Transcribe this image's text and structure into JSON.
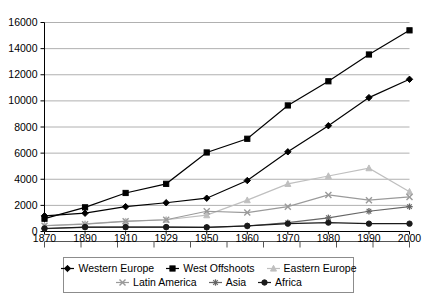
{
  "chart_data": {
    "type": "line",
    "title": "",
    "subtitle": "",
    "xlabel": "",
    "ylabel": "",
    "grid": true,
    "legend_position": "bottom",
    "x": [
      1870,
      1890,
      1910,
      1929,
      1950,
      1960,
      1970,
      1980,
      1990,
      2000
    ],
    "categories": [
      "1870",
      "1890",
      "1910",
      "1929",
      "1950",
      "1960",
      "1970",
      "1980",
      "1990",
      "2000"
    ],
    "xlim": [
      1870,
      2000
    ],
    "ylim": [
      0,
      16000
    ],
    "ytick_values": [
      0,
      2000,
      4000,
      6000,
      8000,
      10000,
      12000,
      14000,
      16000
    ],
    "ytick_labels": [
      "0",
      "2000",
      "4000",
      "6000",
      "8000",
      "10000",
      "12000",
      "14000",
      "16000"
    ],
    "series": [
      {
        "name": "Western Europe",
        "color": "#000000",
        "marker": "diamond",
        "values": [
          1200,
          1400,
          1900,
          2200,
          2550,
          3900,
          6100,
          8100,
          10250,
          11650
        ]
      },
      {
        "name": "West Offshoots",
        "color": "#000000",
        "marker": "square",
        "values": [
          980,
          1850,
          2950,
          3650,
          6050,
          7100,
          9650,
          11500,
          13550,
          15400
        ]
      },
      {
        "name": "Eastern Europe",
        "color": "#bfbfbf",
        "marker": "triangle",
        "values": [
          450,
          580,
          790,
          900,
          1250,
          2400,
          3650,
          4250,
          4850,
          3050
        ]
      },
      {
        "name": "Latin America",
        "color": "#9a9a9a",
        "marker": "cross-x",
        "values": [
          440,
          560,
          780,
          900,
          1550,
          1450,
          1900,
          2800,
          2400,
          2650
        ]
      },
      {
        "name": "Asia",
        "color": "#666666",
        "marker": "asterisk",
        "values": [
          220,
          320,
          330,
          330,
          320,
          420,
          680,
          1050,
          1550,
          1900
        ]
      },
      {
        "name": "Africa",
        "color": "#1a1a1a",
        "marker": "circle",
        "values": [
          230,
          340,
          340,
          340,
          320,
          430,
          600,
          680,
          600,
          600
        ]
      }
    ]
  },
  "legend": {
    "rows": [
      [
        "Western Europe",
        "West Offshoots",
        "Eastern Europe"
      ],
      [
        "Latin America",
        "Asia",
        "Africa"
      ]
    ]
  }
}
